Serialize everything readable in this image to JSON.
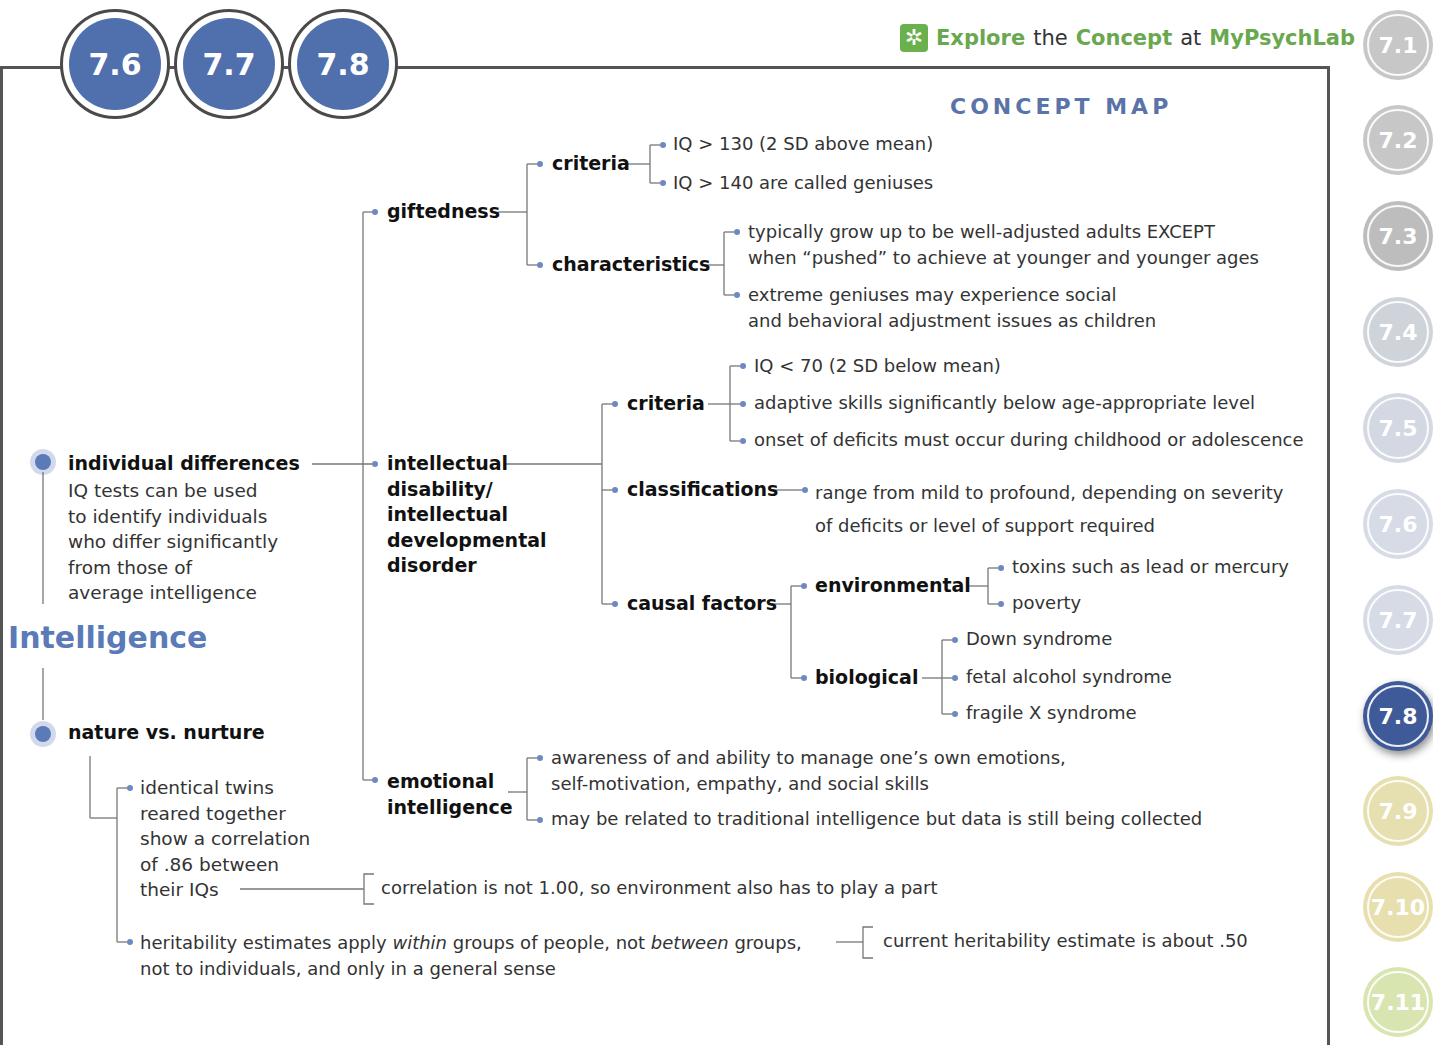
{
  "header": {
    "section_badges": [
      "7.6",
      "7.7",
      "7.8"
    ],
    "explore_link": {
      "icon": "mypsychlab-explore-icon",
      "word1": "Explore",
      "word2": "the",
      "word3": "Concept",
      "word4": "at",
      "word5": "MyPsychLab"
    },
    "title": "CONCEPT MAP"
  },
  "side_tabs": [
    {
      "label": "7.1",
      "color": "#c7c7c7",
      "active": false
    },
    {
      "label": "7.2",
      "color": "#c7c7c7",
      "active": false
    },
    {
      "label": "7.3",
      "color": "#bdbdbd",
      "active": false
    },
    {
      "label": "7.4",
      "color": "#cfd3da",
      "active": false
    },
    {
      "label": "7.5",
      "color": "#d3d8e2",
      "active": false
    },
    {
      "label": "7.6",
      "color": "#d6dbe6",
      "active": false
    },
    {
      "label": "7.7",
      "color": "#d6dbe6",
      "active": false
    },
    {
      "label": "7.8",
      "color": "#3f5a98",
      "active": true
    },
    {
      "label": "7.9",
      "color": "#e6dfb0",
      "active": false
    },
    {
      "label": "7.10",
      "color": "#e8dfae",
      "active": false
    },
    {
      "label": "7.11",
      "color": "#d9e5b0",
      "active": false
    }
  ],
  "concept_map": {
    "root": "Intelligence",
    "individual_differences": {
      "label": "individual differences",
      "description": [
        "IQ tests can be used",
        "to identify individuals",
        "who differ significantly",
        "from those of",
        "average intelligence"
      ],
      "giftedness": {
        "label": "giftedness",
        "criteria": {
          "label": "criteria",
          "items": [
            "IQ > 130 (2 SD above mean)",
            "IQ > 140 are called geniuses"
          ]
        },
        "characteristics": {
          "label": "characteristics",
          "items": [
            [
              "typically grow up to be well-adjusted adults EXCEPT",
              "when “pushed” to achieve at younger and younger ages"
            ],
            [
              "extreme geniuses may experience social",
              "and behavioral adjustment issues as children"
            ]
          ]
        }
      },
      "intellectual_disability": {
        "label_lines": [
          "intellectual",
          "disability/",
          "intellectual",
          "developmental",
          "disorder"
        ],
        "criteria": {
          "label": "criteria",
          "items": [
            "IQ < 70 (2 SD below mean)",
            "adaptive skills significantly below age-appropriate level",
            "onset of deficits must occur during childhood or adolescence"
          ]
        },
        "classifications": {
          "label": "classifications",
          "items": [
            "range from mild to profound, depending on severity",
            "of deficits or level of support required"
          ]
        },
        "causal_factors": {
          "label": "causal factors",
          "environmental": {
            "label": "environmental",
            "items": [
              "toxins such as lead or mercury",
              "poverty"
            ]
          },
          "biological": {
            "label": "biological",
            "items": [
              "Down syndrome",
              "fetal alcohol syndrome",
              "fragile X syndrome"
            ]
          }
        }
      },
      "emotional_intelligence": {
        "label_lines": [
          "emotional",
          "intelligence"
        ],
        "items": [
          [
            "awareness of and ability to manage one’s own emotions,",
            "self-motivation, empathy, and social skills"
          ],
          [
            "may be related to traditional intelligence but data is still being collected"
          ]
        ]
      }
    },
    "nature_vs_nurture": {
      "label": "nature vs. nurture",
      "twins": {
        "lines": [
          "identical twins",
          "reared together",
          "show a correlation",
          "of .86 between",
          "their IQs"
        ],
        "note": "correlation is not 1.00, so environment also has to play a part"
      },
      "heritability": {
        "line1_a": "heritability estimates apply ",
        "line1_b": "within",
        "line1_c": " groups of people, not ",
        "line1_d": "between",
        "line1_e": " groups,",
        "line2": "not to individuals, and only in a general sense",
        "note": "current heritability estimate is about .50"
      }
    }
  }
}
